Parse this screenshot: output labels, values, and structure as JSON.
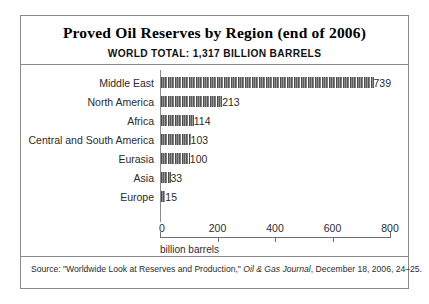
{
  "figure": {
    "title": "Proved Oil Reserves by Region (end of 2006)",
    "subtitle": "WORLD TOTAL: 1,317 BILLION BARRELS",
    "units_label": "billion barrels",
    "source_prefix": "Source: \"Worldwide Look at Reserves and Production,\" ",
    "source_italic": "Oil & Gas Journal",
    "source_suffix": ", December 18, 2006, 24–25."
  },
  "chart_data": {
    "type": "bar",
    "orientation": "horizontal",
    "title": "Proved Oil Reserves by Region (end of 2006)",
    "subtitle": "WORLD TOTAL: 1,317 BILLION BARRELS",
    "xlabel": "billion barrels",
    "ylabel": "",
    "xlim": [
      0,
      800
    ],
    "xticks": [
      0,
      200,
      400,
      600,
      800
    ],
    "xtick_labels": [
      "0",
      "200",
      "400",
      "600",
      "800"
    ],
    "grid": false,
    "legend": false,
    "bar_fill": "barrel-glyph-repeat",
    "bar_color": "#6d6d6d",
    "categories": [
      "Middle East",
      "North America",
      "Africa",
      "Central and South America",
      "Eurasia",
      "Asia",
      "Europe"
    ],
    "values": [
      739,
      213,
      114,
      103,
      100,
      33,
      15
    ],
    "value_labels": [
      "739",
      "213",
      "114",
      "103",
      "100",
      "33",
      "15"
    ],
    "units": "billion barrels",
    "world_total": 1317
  }
}
